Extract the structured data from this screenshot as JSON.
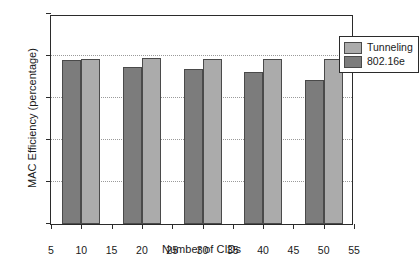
{
  "chart_data": {
    "type": "bar",
    "title": "",
    "xlabel": "Number of CIDs",
    "ylabel": "MAC Efficiency (percentage)",
    "categories": [
      10,
      20,
      30,
      40,
      50
    ],
    "xlim": [
      5,
      55
    ],
    "ylim": [
      50,
      100
    ],
    "xticks": [
      5,
      10,
      15,
      20,
      25,
      30,
      35,
      40,
      45,
      50,
      55
    ],
    "yticks": [
      50,
      60,
      70,
      80,
      90,
      100
    ],
    "grid": "horizontal-dotted",
    "legend_position": "top-right",
    "series": [
      {
        "name": "802.16e",
        "color": "#7c7c7c",
        "values": [
          89.0,
          87.5,
          86.9,
          86.1,
          84.3
        ]
      },
      {
        "name": "Tunneling",
        "color": "#ababab",
        "values": [
          89.4,
          89.5,
          89.2,
          89.2,
          89.2
        ]
      }
    ]
  },
  "legend": {
    "items": [
      {
        "label": "Tunneling",
        "swatch": "light"
      },
      {
        "label": "802.16e",
        "swatch": "dark"
      }
    ]
  },
  "caption": {
    "text": ""
  }
}
